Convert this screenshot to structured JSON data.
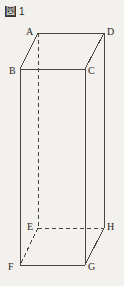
{
  "figure": {
    "caption_glyph": "図",
    "caption_glyph_name": "zu-kanji-glyph",
    "caption_number": "1",
    "background_color": "#f3f1ee",
    "line_color": "#4a4643",
    "label_color": "#2b2825",
    "shape": "rectangular prism",
    "projection": "oblique",
    "vertices": [
      {
        "id": "A",
        "x": 38,
        "y": 33,
        "label_x": 26,
        "label_y": 33,
        "hidden": true
      },
      {
        "id": "B",
        "x": 20,
        "y": 69,
        "label_x": 9,
        "label_y": 72,
        "hidden": false
      },
      {
        "id": "C",
        "x": 85,
        "y": 69,
        "label_x": 88,
        "label_y": 72,
        "hidden": false
      },
      {
        "id": "D",
        "x": 104,
        "y": 33,
        "label_x": 107,
        "label_y": 33,
        "hidden": false
      },
      {
        "id": "E",
        "x": 38,
        "y": 228,
        "label_x": 27,
        "label_y": 228,
        "hidden": true
      },
      {
        "id": "F",
        "x": 20,
        "y": 265,
        "label_x": 8,
        "label_y": 268,
        "hidden": false
      },
      {
        "id": "G",
        "x": 85,
        "y": 265,
        "label_x": 88,
        "label_y": 268,
        "hidden": false
      },
      {
        "id": "H",
        "x": 104,
        "y": 228,
        "label_x": 107,
        "label_y": 228,
        "hidden": false
      }
    ],
    "solid_edges": [
      {
        "name": "edge-AD",
        "from": "A",
        "to": "D"
      },
      {
        "name": "edge-DC",
        "from": "D",
        "to": "C"
      },
      {
        "name": "edge-CB",
        "from": "C",
        "to": "B"
      },
      {
        "name": "edge-BA",
        "from": "B",
        "to": "A"
      },
      {
        "name": "edge-BF",
        "from": "B",
        "to": "F"
      },
      {
        "name": "edge-CG",
        "from": "C",
        "to": "G"
      },
      {
        "name": "edge-DH",
        "from": "D",
        "to": "H"
      },
      {
        "name": "edge-FG",
        "from": "F",
        "to": "G"
      },
      {
        "name": "edge-GH",
        "from": "G",
        "to": "H"
      }
    ],
    "dashed_edges": [
      {
        "name": "edge-AE",
        "from": "A",
        "to": "E"
      },
      {
        "name": "edge-EH",
        "from": "E",
        "to": "H"
      },
      {
        "name": "edge-EF",
        "from": "E",
        "to": "F"
      }
    ]
  }
}
